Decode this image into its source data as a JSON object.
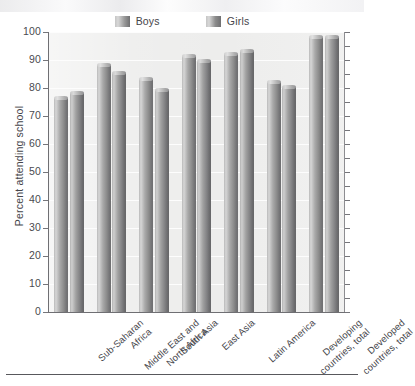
{
  "chart_data": {
    "type": "bar",
    "title": "",
    "subtitle": "",
    "xlabel": "",
    "ylabel": "Percent attending school",
    "ylim": [
      0,
      100
    ],
    "ytick_step": 10,
    "yticks": [
      "100",
      "90",
      "80",
      "70",
      "60",
      "50",
      "40",
      "30",
      "20",
      "10",
      "0"
    ],
    "grid": true,
    "legend_position": "top-center",
    "categories": [
      "Sub-Saharan\nAfrica",
      "Middle East and\nNorth Africa",
      "South Asia",
      "East Asia",
      "Latin America",
      "Developing\ncountries, total",
      "Developed\ncountries, total"
    ],
    "series": [
      {
        "name": "Boys",
        "color": "#9a9a9a",
        "values": [
          77,
          89,
          84,
          92,
          93,
          83,
          99
        ]
      },
      {
        "name": "Girls",
        "color": "#8c8c8c",
        "values": [
          79,
          86,
          80,
          90.5,
          94,
          81,
          99
        ]
      }
    ]
  },
  "legend": {
    "items": [
      {
        "label": "Boys",
        "swatch_color": "#9a9a9a"
      },
      {
        "label": "Girls",
        "swatch_color": "#8c8c8c"
      }
    ]
  },
  "axes": {
    "y_axis_title": "Percent attending school"
  },
  "colors": {
    "plot_background": "#ececeb",
    "gridline": "#fdfdfd",
    "axis_line": "#6f6f73",
    "text": "#45454a",
    "bottom_rule": "#58585c"
  }
}
